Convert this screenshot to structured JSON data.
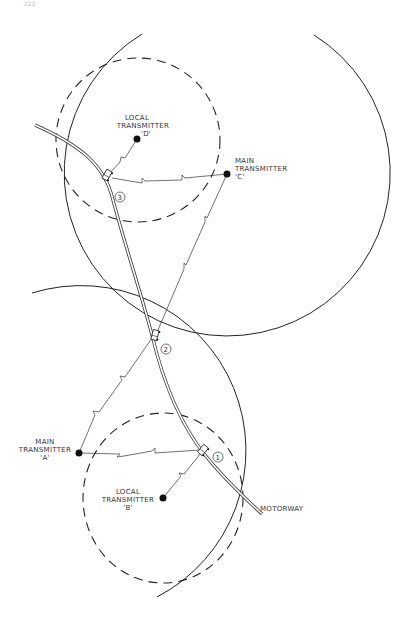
{
  "page_number": "222",
  "diagram": {
    "road_label": "MOTORWAY",
    "colors": {
      "line": "#222222",
      "background": "#ffffff",
      "label": "#333333"
    },
    "transmitters": [
      {
        "id": "A",
        "type": "main",
        "line1": "MAIN",
        "line2": "TRANSMITTER",
        "line3": "'A'"
      },
      {
        "id": "B",
        "type": "local",
        "line1": "LOCAL",
        "line2": "TRANSMITTER",
        "line3": "'B'"
      },
      {
        "id": "C",
        "type": "main",
        "line1": "MAIN",
        "line2": "TRANSMITTER",
        "line3": "'C'"
      },
      {
        "id": "D",
        "type": "local",
        "line1": "LOCAL",
        "line2": "TRANSMITTER",
        "line3": "'D'"
      }
    ],
    "vehicle_positions": [
      {
        "marker": "1"
      },
      {
        "marker": "2"
      },
      {
        "marker": "3"
      }
    ],
    "coverage": {
      "main_areas": "solid circle",
      "local_areas": "dashed circle"
    }
  }
}
